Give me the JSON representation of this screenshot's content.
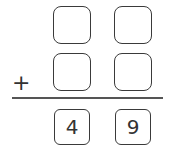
{
  "problem": {
    "operator": "+",
    "addend1": [
      "",
      ""
    ],
    "addend2": [
      "",
      ""
    ],
    "sum": [
      "4",
      "9"
    ]
  }
}
